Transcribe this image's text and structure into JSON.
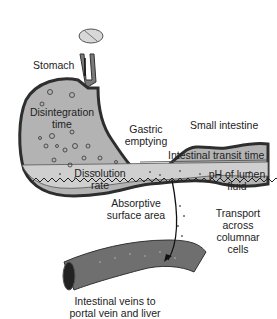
{
  "diagram": {
    "colors": {
      "tissue": "#b8b8b8",
      "wall": "#3a3a3a",
      "lumen": "#c9c9c9",
      "vein": "#6f6f6f",
      "text": "#222222"
    },
    "labels": {
      "stomach": "Stomach",
      "disintegration_1": "Disintegration",
      "disintegration_2": "time",
      "gastric_1": "Gastric",
      "gastric_2": "emptying",
      "small_intestine": "Small intestine",
      "transit": "Intestinal transit time",
      "dissolution_1": "Dissolution",
      "dissolution_2": "rate",
      "ph_1": "pH of lumen",
      "ph_2": "fluid",
      "absorptive_1": "Absorptive",
      "absorptive_2": "surface area",
      "transport_1": "Transport",
      "transport_2": "across",
      "transport_3": "columnar",
      "transport_4": "cells",
      "veins_1": "Intestinal veins to",
      "veins_2": "portal vein and liver"
    },
    "icons": [
      "tablet-icon",
      "arrow-icon"
    ]
  }
}
